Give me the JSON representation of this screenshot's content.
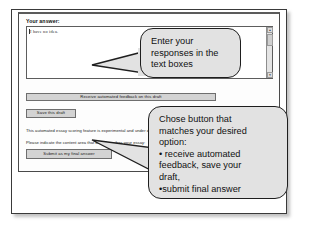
{
  "form": {
    "answer_label": "Your answer:",
    "answer_value": "I have no idea.",
    "buttons": {
      "feedback": "Receive automated feedback on this draft",
      "save": "Save this draft",
      "submit": "Submit as my final answer"
    },
    "notes": {
      "experimental": "This automated essay scoring feature is experimental and under development.",
      "content_area": "Please indicate the content area that best describes your essay:"
    },
    "scrollbar": {
      "up_arrow": "▲",
      "down_arrow": "▼"
    }
  },
  "callouts": {
    "enter": {
      "line1": "Enter your",
      "line2": "responses in the",
      "line3": "text boxes"
    },
    "choose": {
      "line1": "Chose button that",
      "line2": "matches your desired",
      "line3": "option:",
      "line4": "• receive automated",
      "line5": "feedback, save your",
      "line6": "draft,",
      "line7": "•submit final answer"
    }
  },
  "colors": {
    "callout_fill": "#e2e2e2",
    "callout_border": "#1e1e1e",
    "button_face": "#d3d3d3",
    "page_background": "#ffffff"
  }
}
